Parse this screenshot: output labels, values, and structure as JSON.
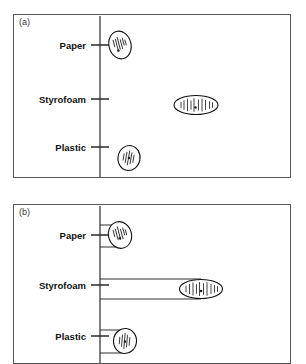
{
  "figure": {
    "panels": [
      {
        "id": "a",
        "label": "(a)",
        "frame": {
          "x": 13,
          "y": 14,
          "w": 278,
          "h": 164
        },
        "axis_x": 86,
        "categories": [
          {
            "name": "Paper",
            "label": "Paper",
            "y": 30,
            "tick_y": 30
          },
          {
            "name": "Styrofoam",
            "label": "Styrofoam",
            "y": 84,
            "tick_y": 84
          },
          {
            "name": "Plastic",
            "label": "Plastic",
            "y": 132,
            "tick_y": 132
          }
        ],
        "brackets": false,
        "clusters": [
          {
            "name": "Paper",
            "cx": 106,
            "cy": 30,
            "rx": 11,
            "ry": 14,
            "rotate": -15,
            "markers": [
              {
                "dx": -5.5,
                "dy": -3.0,
                "len": 7.5
              },
              {
                "dx": -3.0,
                "dy": -1.5,
                "len": 11.0
              },
              {
                "dx": -0.8,
                "dy": -2.0,
                "len": 13.0
              },
              {
                "dx": 1.6,
                "dy": -0.5,
                "len": 10.0
              },
              {
                "dx": 4.0,
                "dy": -2.5,
                "len": 8.0
              },
              {
                "dx": 6.0,
                "dy": -1.0,
                "len": 6.0
              }
            ],
            "dot": {
              "dx": -3.0,
              "dy": 5.0
            }
          },
          {
            "name": "Styrofoam",
            "cx": 182,
            "cy": 90,
            "rx": 22,
            "ry": 9.5,
            "rotate": 0,
            "markers": [
              {
                "dx": -15.0,
                "dy": 0.0,
                "len": 6.5
              },
              {
                "dx": -12.0,
                "dy": 0.0,
                "len": 9.5
              },
              {
                "dx": -8.5,
                "dy": 0.0,
                "len": 12.5
              },
              {
                "dx": -5.0,
                "dy": 0.0,
                "len": 9.0
              },
              {
                "dx": -2.0,
                "dy": 0.0,
                "len": 13.5
              },
              {
                "dx": 2.5,
                "dy": 0.0,
                "len": 11.0
              },
              {
                "dx": 6.0,
                "dy": 0.0,
                "len": 13.0
              },
              {
                "dx": 9.5,
                "dy": 0.0,
                "len": 10.0
              },
              {
                "dx": 13.5,
                "dy": 0.0,
                "len": 7.5
              },
              {
                "dx": 16.5,
                "dy": 0.0,
                "len": 5.5
              }
            ],
            "dot": {
              "dx": -0.5,
              "dy": 2.5
            }
          },
          {
            "name": "Plastic",
            "cx": 115,
            "cy": 143,
            "rx": 11,
            "ry": 12.5,
            "rotate": 10,
            "markers": [
              {
                "dx": -5.5,
                "dy": 0.0,
                "len": 7.0
              },
              {
                "dx": -3.0,
                "dy": 0.0,
                "len": 11.5
              },
              {
                "dx": -0.5,
                "dy": 0.0,
                "len": 15.0
              },
              {
                "dx": 2.0,
                "dy": 0.0,
                "len": 12.0
              },
              {
                "dx": 4.5,
                "dy": 0.0,
                "len": 8.0
              }
            ],
            "dot": {
              "dx": 0.0,
              "dy": 0.0
            }
          }
        ]
      },
      {
        "id": "b",
        "label": "(b)",
        "frame": {
          "x": 13,
          "y": 204,
          "w": 278,
          "h": 160
        },
        "axis_x": 86,
        "categories": [
          {
            "name": "Paper",
            "label": "Paper",
            "y": 30,
            "tick_y": 30
          },
          {
            "name": "Styrofoam",
            "label": "Styrofoam",
            "y": 80,
            "tick_y": 80
          },
          {
            "name": "Plastic",
            "label": "Plastic",
            "y": 131,
            "tick_y": 131
          }
        ],
        "brackets": true,
        "clusters": [
          {
            "name": "Paper",
            "cx": 106,
            "cy": 30,
            "rx": 11.5,
            "ry": 13.5,
            "rotate": -15,
            "bracket": {
              "x1": 86,
              "x2": 106,
              "y_top": 20,
              "y_bot": 42
            },
            "markers": [
              {
                "dx": -5.5,
                "dy": -3.0,
                "len": 7.5
              },
              {
                "dx": -3.0,
                "dy": -1.5,
                "len": 11.5
              },
              {
                "dx": -0.5,
                "dy": -2.0,
                "len": 14.0
              },
              {
                "dx": 2.0,
                "dy": -0.5,
                "len": 10.5
              },
              {
                "dx": 4.5,
                "dy": -2.5,
                "len": 8.0
              },
              {
                "dx": 6.5,
                "dy": -1.0,
                "len": 6.0
              }
            ],
            "dot": {
              "dx": -1.0,
              "dy": 3.0
            }
          },
          {
            "name": "Styrofoam",
            "cx": 187,
            "cy": 84,
            "rx": 21.5,
            "ry": 9.5,
            "rotate": 0,
            "bracket": {
              "x1": 86,
              "x2": 187,
              "y_top": 74,
              "y_bot": 94
            },
            "markers": [
              {
                "dx": -15.0,
                "dy": 0.0,
                "len": 6.5
              },
              {
                "dx": -11.5,
                "dy": 0.0,
                "len": 10.0
              },
              {
                "dx": -8.0,
                "dy": 0.0,
                "len": 13.0
              },
              {
                "dx": -4.5,
                "dy": 0.0,
                "len": 9.5
              },
              {
                "dx": -1.5,
                "dy": 0.0,
                "len": 14.0
              },
              {
                "dx": 2.5,
                "dy": 0.0,
                "len": 11.5
              },
              {
                "dx": 6.0,
                "dy": 0.0,
                "len": 13.5
              },
              {
                "dx": 10.0,
                "dy": 0.0,
                "len": 10.0
              },
              {
                "dx": 13.5,
                "dy": 0.0,
                "len": 7.5
              },
              {
                "dx": 16.5,
                "dy": 0.0,
                "len": 5.5
              }
            ],
            "dot": {
              "dx": 0.0,
              "dy": 2.0
            }
          },
          {
            "name": "Plastic",
            "cx": 111,
            "cy": 136,
            "rx": 11.5,
            "ry": 12.5,
            "rotate": 5,
            "bracket": {
              "x1": 86,
              "x2": 111,
              "y_top": 125,
              "y_bot": 148
            },
            "markers": [
              {
                "dx": -5.5,
                "dy": 0.0,
                "len": 7.5
              },
              {
                "dx": -3.0,
                "dy": 0.0,
                "len": 12.0
              },
              {
                "dx": -0.5,
                "dy": 0.0,
                "len": 16.0
              },
              {
                "dx": 2.0,
                "dy": 0.0,
                "len": 12.5
              },
              {
                "dx": 4.5,
                "dy": 0.0,
                "len": 8.5
              }
            ],
            "dot": {
              "dx": 0.0,
              "dy": 0.5
            }
          }
        ]
      }
    ],
    "style": {
      "frame_color": "#555555",
      "axis_color": "#1a1a1a",
      "cluster_color": "#111111",
      "marker_color": "#222222",
      "label_color": "#111111",
      "panel_label_color": "#3a3a3a",
      "background": "#ffffff"
    }
  },
  "chart_data": {
    "type": "scatter",
    "title": "",
    "xlabel": "",
    "ylabel": "",
    "categories": [
      "Paper",
      "Styrofoam",
      "Plastic"
    ],
    "grid": false,
    "legend": "none",
    "panels": [
      {
        "panel": "(a)",
        "note": "Cluster ellipses with internal vertical data ticks; reference axis line at left of data area.",
        "series": [
          {
            "name": "Paper",
            "cluster_center_x": 106,
            "cluster_center_y": 30,
            "n_markers": 6,
            "spread": "narrow-vertical"
          },
          {
            "name": "Styrofoam",
            "cluster_center_x": 182,
            "cluster_center_y": 90,
            "n_markers": 10,
            "spread": "wide-horizontal"
          },
          {
            "name": "Plastic",
            "cluster_center_x": 115,
            "cluster_center_y": 143,
            "n_markers": 5,
            "spread": "narrow-round"
          }
        ]
      },
      {
        "panel": "(b)",
        "note": "Same clusters with horizontal bracket lines connecting the axis to each cluster.",
        "series": [
          {
            "name": "Paper",
            "cluster_center_x": 106,
            "cluster_center_y": 30,
            "n_markers": 6,
            "spread": "narrow-vertical"
          },
          {
            "name": "Styrofoam",
            "cluster_center_x": 187,
            "cluster_center_y": 84,
            "n_markers": 10,
            "spread": "wide-horizontal"
          },
          {
            "name": "Plastic",
            "cluster_center_x": 111,
            "cluster_center_y": 136,
            "n_markers": 5,
            "spread": "narrow-round"
          }
        ]
      }
    ]
  }
}
